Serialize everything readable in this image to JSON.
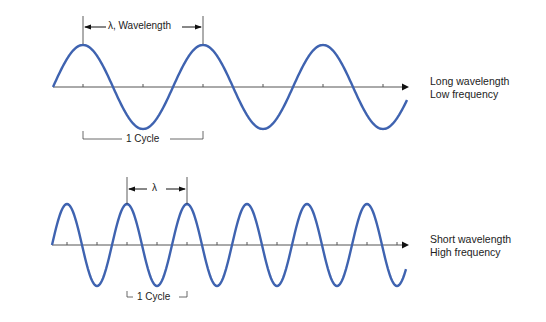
{
  "long_wave": {
    "title_line1": "Long wavelength",
    "title_line2": "Low frequency",
    "wavelength_label": "λ, Wavelength",
    "cycle_label": "1 Cycle",
    "wavelength_px": 120,
    "cycles_shown": 3
  },
  "short_wave": {
    "title_line1": "Short wavelength",
    "title_line2": "High frequency",
    "wavelength_label": "λ",
    "cycle_label": "1 Cycle",
    "wavelength_px": 60,
    "cycles_shown": 6
  },
  "colors": {
    "wave": "#3f63b0",
    "axis": "#555555",
    "text": "#222222"
  }
}
